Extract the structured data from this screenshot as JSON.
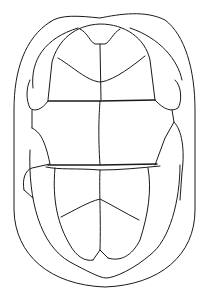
{
  "figure": {
    "subject": "turtle plastron line drawing",
    "stroke_color": "#1a1a1a",
    "background_color": "#ffffff"
  }
}
